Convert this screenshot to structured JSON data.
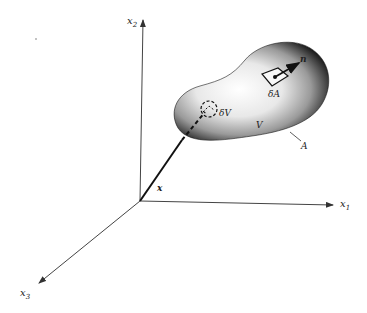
{
  "figure": {
    "axes": {
      "x1": {
        "label": "x",
        "subscript": "1"
      },
      "x2": {
        "label": "x",
        "subscript": "2"
      },
      "x3": {
        "label": "x",
        "subscript": "3"
      }
    },
    "position_vector": {
      "label": "x"
    },
    "volume_element": {
      "label": "δV"
    },
    "area_element": {
      "label": "δA"
    },
    "normal": {
      "label": "n"
    },
    "volume": {
      "label": "V"
    },
    "surface": {
      "label": "A"
    },
    "colors": {
      "line": "#333333",
      "body_dark": "#1a1a1a",
      "body_light": "#f4f4f4"
    }
  }
}
